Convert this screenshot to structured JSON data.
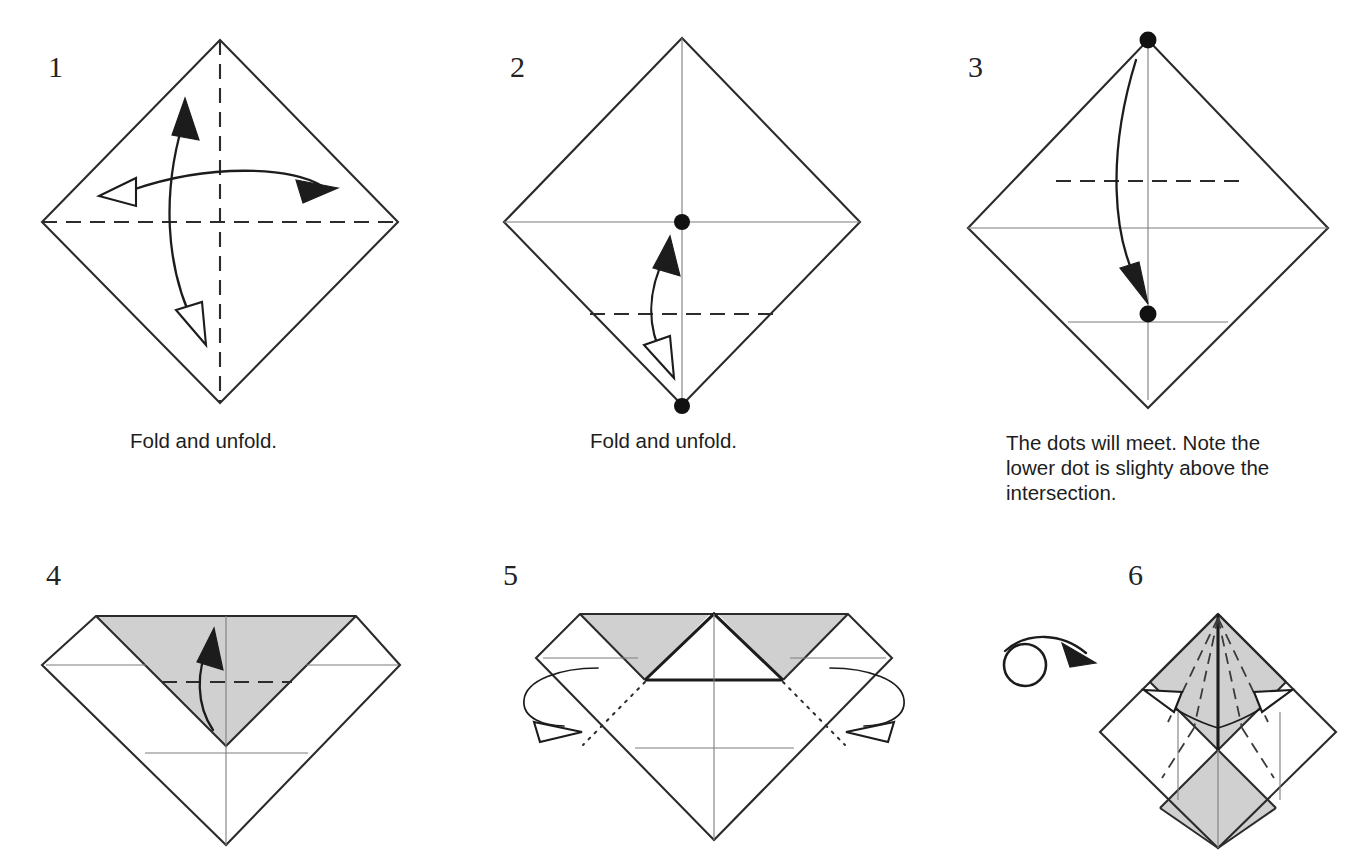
{
  "document": {
    "kind": "origami-folding-instructions",
    "background_color": "#ffffff",
    "ink_color": "#2b2b2b",
    "shade_color": "#d0d0d0",
    "accent_dot_color": "#111111"
  },
  "steps": [
    {
      "number": "1",
      "caption": "Fold and unfold.",
      "figure": "square-rotated-diamond-with-both-diagonal-creases",
      "creases": [
        "vertical-dashed-centerline",
        "horizontal-dashed-centerline"
      ],
      "arrows": [
        "double-headed-vertical-curved-arrow",
        "double-headed-horizontal-curved-arrow"
      ],
      "dots": []
    },
    {
      "number": "2",
      "caption": "Fold and unfold.",
      "figure": "diamond-with-solid-centerlines-and-lower-quarter-crease",
      "creases": [
        "vertical-solid-centerline",
        "horizontal-solid-centerline",
        "lower-quarter-dashed-crease"
      ],
      "arrows": [
        "double-headed-vertical-curved-arrow"
      ],
      "dots": [
        "center-dot",
        "bottom-vertex-dot"
      ]
    },
    {
      "number": "3",
      "caption": "The dots will meet. Note the lower dot is slighty above the intersection.",
      "figure": "diamond-with-upper-dashed-crease-and-two-dots",
      "creases": [
        "upper-quarter-dashed-crease",
        "horizontal-solid-centerline",
        "lower-quarter-solid-crease",
        "vertical-solid-centerline"
      ],
      "arrows": [
        "single-curved-arrow-downward"
      ],
      "dots": [
        "top-vertex-dot",
        "lower-dot-above-intersection"
      ]
    },
    {
      "number": "4",
      "caption": "",
      "figure": "top-flap-folded-down-gray-triangle",
      "creases": [
        "dashed-horizontal-crease-on-gray-triangle",
        "thin-horizontal-creases",
        "thin-vertical-centerline"
      ],
      "arrows": [
        "single-curved-arrow-upward"
      ],
      "dots": []
    },
    {
      "number": "5",
      "caption": "",
      "figure": "center-white-triangle-flanked-by-two-gray-triangles",
      "creases": [
        "dotted-diagonal-creases",
        "thin-horizontal-creases",
        "thin-vertical-centerline"
      ],
      "arrows": [
        "left-wrap-around-arrow",
        "right-wrap-around-arrow"
      ],
      "dots": []
    },
    {
      "number": "6",
      "caption": "",
      "figure": "diamond-with-gray-upper-triangle-and-gray-lower-center-diamond",
      "creases": [
        "dashed-fan-creases-from-apex",
        "thin-vertical-centerline"
      ],
      "arrows": [
        "left-outward-arrow",
        "right-outward-arrow",
        "turn-over-symbol"
      ],
      "dots": []
    }
  ],
  "symbols": {
    "turn_over": "turn-the-model-over"
  }
}
